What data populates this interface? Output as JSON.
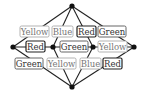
{
  "diagram": {
    "vertices": [
      {
        "id": "top",
        "x": 72,
        "y": 6
      },
      {
        "id": "left",
        "x": 13,
        "y": 47
      },
      {
        "id": "mid-left",
        "x": 53,
        "y": 47
      },
      {
        "id": "mid-right",
        "x": 93,
        "y": 47
      },
      {
        "id": "right",
        "x": 134,
        "y": 47
      },
      {
        "id": "bottom",
        "x": 72,
        "y": 87
      }
    ],
    "edges": [
      {
        "from": "top",
        "to": "left"
      },
      {
        "from": "top",
        "to": "mid-left"
      },
      {
        "from": "top",
        "to": "mid-right"
      },
      {
        "from": "top",
        "to": "right"
      },
      {
        "from": "left",
        "to": "mid-left"
      },
      {
        "from": "mid-left",
        "to": "mid-right"
      },
      {
        "from": "mid-right",
        "to": "right"
      },
      {
        "from": "left",
        "to": "bottom"
      },
      {
        "from": "mid-left",
        "to": "bottom"
      },
      {
        "from": "mid-right",
        "to": "bottom"
      },
      {
        "from": "right",
        "to": "bottom"
      }
    ],
    "labels": {
      "top_row": [
        {
          "text": "Yellow",
          "emphasis": "light",
          "x": 20,
          "y": 26,
          "w": 29,
          "h": 11
        },
        {
          "text": "Blue",
          "emphasis": "light",
          "x": 52,
          "y": 26,
          "w": 21,
          "h": 11
        },
        {
          "text": "Red",
          "emphasis": "dark",
          "x": 77,
          "y": 26,
          "w": 19,
          "h": 11
        },
        {
          "text": "Green",
          "emphasis": "medium",
          "x": 98,
          "y": 26,
          "w": 28,
          "h": 11
        }
      ],
      "middle_row": [
        {
          "text": "Red",
          "emphasis": "dark",
          "x": 26,
          "y": 41,
          "w": 19,
          "h": 11
        },
        {
          "text": "Green",
          "emphasis": "medium",
          "x": 60,
          "y": 41,
          "w": 28,
          "h": 11
        },
        {
          "text": "Yellow",
          "emphasis": "light",
          "x": 98,
          "y": 41,
          "w": 29,
          "h": 11
        }
      ],
      "bottom_row": [
        {
          "text": "Green",
          "emphasis": "medium",
          "x": 15,
          "y": 58,
          "w": 28,
          "h": 11
        },
        {
          "text": "Yellow",
          "emphasis": "light",
          "x": 47,
          "y": 58,
          "w": 29,
          "h": 11
        },
        {
          "text": "Blue",
          "emphasis": "light",
          "x": 80,
          "y": 58,
          "w": 21,
          "h": 11
        },
        {
          "text": "Red",
          "emphasis": "dark",
          "x": 103,
          "y": 58,
          "w": 19,
          "h": 11
        }
      ]
    },
    "colors": {
      "edge": "#222222",
      "vertex": "#111111",
      "label_bg": "#ffffff",
      "border_dark": "#222222",
      "border_medium": "#555555",
      "border_light": "#aaaaaa",
      "text_dark": "#333333",
      "text_light": "#777777"
    }
  }
}
